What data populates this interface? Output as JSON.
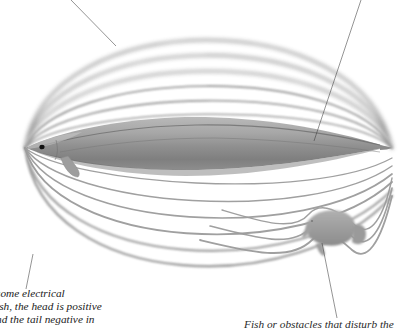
{
  "figure": {
    "kind": "electric-field-diagram",
    "background_color": "#ffffff",
    "eel": {
      "body_color": "#9a9a9a",
      "body_shadow_color": "#6f6f6f",
      "eye_color": "#111111",
      "head_x": 25,
      "tail_x": 392,
      "axis_y": 148
    },
    "small_fish": {
      "label_role": "field-disturbing-fish",
      "body_color": "#a3a3a3",
      "x": 330,
      "y": 228
    },
    "field_lines": {
      "color": "#9b9b9b",
      "count_upper": 6,
      "count_lower": 6,
      "style": "concentric blurred arcs converging at head and tail"
    },
    "leaders": [
      {
        "name": "leader-top-left",
        "from": [
          71,
          0
        ],
        "to": [
          116,
          46
        ]
      },
      {
        "name": "leader-top-right",
        "from": [
          361,
          0
        ],
        "to": [
          314,
          141
        ]
      },
      {
        "name": "leader-left-caption",
        "from": [
          33,
          254
        ],
        "to": [
          26,
          289
        ]
      },
      {
        "name": "leader-right-caption",
        "from": [
          322,
          243
        ],
        "to": [
          337,
          318
        ]
      }
    ]
  },
  "captions": {
    "left": {
      "name": "caption-electric-field",
      "lines": [
        "some electrical",
        "ish, the head is positive",
        "nd the tail negative in"
      ]
    },
    "right": {
      "name": "caption-fish-obstacles",
      "lines": [
        "Fish or obstacles that disturb the"
      ]
    }
  }
}
